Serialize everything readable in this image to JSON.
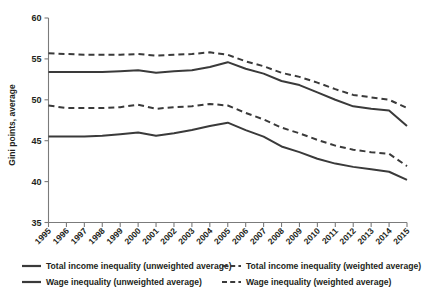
{
  "chart_data": {
    "type": "line",
    "title": "",
    "xlabel": "",
    "ylabel": "Gini points, average",
    "ylim": [
      35,
      60
    ],
    "yticks": [
      35,
      40,
      45,
      50,
      55,
      60
    ],
    "ytick_labels": [
      "35",
      "40",
      "45",
      "50",
      "55",
      "60"
    ],
    "grid": false,
    "legend_position": "bottom",
    "x": [
      1995,
      1996,
      1997,
      1998,
      1999,
      2000,
      2001,
      2002,
      2003,
      2004,
      2005,
      2006,
      2007,
      2008,
      2009,
      2010,
      2011,
      2012,
      2013,
      2014,
      2015
    ],
    "xtick_labels": [
      "1995",
      "1996",
      "1997",
      "1998",
      "1999",
      "2000",
      "2001",
      "2002",
      "2003",
      "2004",
      "2005",
      "2006",
      "2007",
      "2008",
      "2009",
      "2010",
      "2011",
      "2012",
      "2013",
      "2014",
      "2015"
    ],
    "series": [
      {
        "name": "Total income inequality (weighted average)",
        "style": "dashed",
        "color": "#3a3a3a",
        "values": [
          55.7,
          55.6,
          55.5,
          55.5,
          55.5,
          55.6,
          55.4,
          55.5,
          55.6,
          55.8,
          55.5,
          54.7,
          54.1,
          53.3,
          52.8,
          52.1,
          51.3,
          50.6,
          50.3,
          50.0,
          49.0
        ]
      },
      {
        "name": "Total income inequality (unweighted average)",
        "style": "solid",
        "color": "#3a3a3a",
        "values": [
          53.4,
          53.4,
          53.4,
          53.4,
          53.5,
          53.6,
          53.3,
          53.5,
          53.6,
          54.0,
          54.6,
          53.8,
          53.2,
          52.3,
          51.8,
          50.9,
          50.0,
          49.2,
          48.9,
          48.7,
          46.8
        ]
      },
      {
        "name": "Wage inequality (weighted average)",
        "style": "dashed",
        "color": "#3a3a3a",
        "values": [
          49.3,
          49.0,
          49.0,
          49.0,
          49.1,
          49.4,
          48.9,
          49.1,
          49.2,
          49.5,
          49.3,
          48.4,
          47.6,
          46.6,
          45.9,
          45.1,
          44.4,
          43.9,
          43.6,
          43.4,
          41.9
        ]
      },
      {
        "name": "Wage inequality (unweighted average)",
        "style": "solid",
        "color": "#3a3a3a",
        "values": [
          45.5,
          45.5,
          45.5,
          45.6,
          45.8,
          46.0,
          45.6,
          45.9,
          46.3,
          46.8,
          47.2,
          46.3,
          45.5,
          44.3,
          43.6,
          42.8,
          42.2,
          41.8,
          41.5,
          41.2,
          40.2
        ]
      }
    ]
  },
  "axes": {
    "ylabel": "Gini points, average"
  },
  "legend": {
    "items": [
      {
        "label": "Total income inequality (unweighted average)",
        "style": "solid"
      },
      {
        "label": "Total income inequality (weighted average)",
        "style": "dashed"
      },
      {
        "label": "Wage inequality (unweighted average)",
        "style": "solid"
      },
      {
        "label": "Wage inequality (weighted average)",
        "style": "dashed"
      }
    ]
  },
  "colors": {
    "line": "#3a3a3a",
    "axis": "#7b7b7b",
    "text": "#231f20",
    "background": "#ffffff"
  }
}
